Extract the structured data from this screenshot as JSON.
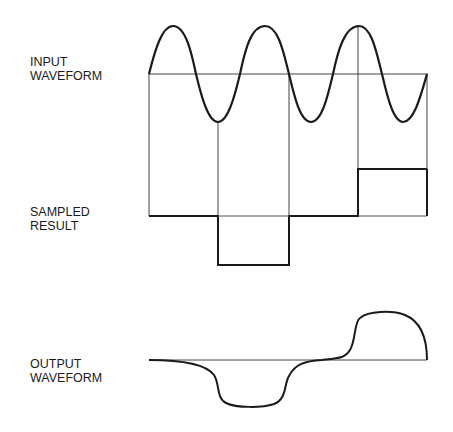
{
  "labels": {
    "input": {
      "line1": "INPUT",
      "line2": "WAVEFORM"
    },
    "sampled": {
      "line1": "SAMPLED",
      "line2": "RESULT"
    },
    "output": {
      "line1": "OUTPUT",
      "line2": "WAVEFORM"
    }
  },
  "colors": {
    "stroke": "#1a1a1a",
    "thin": "#444444"
  }
}
